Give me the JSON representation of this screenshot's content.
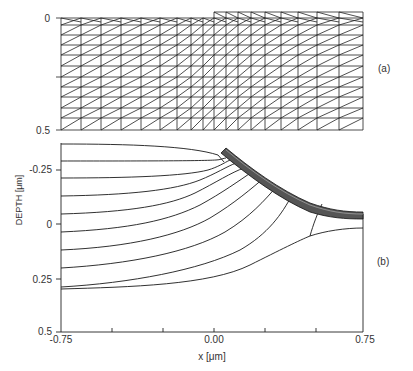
{
  "figure": {
    "panel_a": {
      "label": "(a)",
      "y_ticks": [
        {
          "value": 0,
          "label": "0"
        },
        {
          "value": 0.5,
          "label": "0.5"
        }
      ],
      "description": "Triangular finite-element mesh with a raised step on the right half"
    },
    "panel_b": {
      "label": "(b)",
      "ylabel": "DEPTH [μm]",
      "xlabel": "x [μm]",
      "y_ticks": [
        {
          "value": -0.25,
          "label": "-0.25"
        },
        {
          "value": 0,
          "label": "0"
        },
        {
          "value": 0.25,
          "label": "0.25"
        },
        {
          "value": 0.5,
          "label": "0.5"
        }
      ],
      "x_ticks": [
        {
          "value": -0.75,
          "label": "-0.75"
        },
        {
          "value": -0.5,
          "label": ""
        },
        {
          "value": -0.25,
          "label": ""
        },
        {
          "value": 0.0,
          "label": "0.00"
        },
        {
          "value": 0.25,
          "label": ""
        },
        {
          "value": 0.5,
          "label": ""
        },
        {
          "value": 0.75,
          "label": "0.75"
        }
      ]
    }
  },
  "chart_data": [
    {
      "type": "diagram",
      "title": "(a) finite-element mesh",
      "ylabel": "",
      "ylim": [
        0,
        0.5
      ],
      "rows": 11,
      "columns_left": 14,
      "columns_right": 12
    },
    {
      "type": "line",
      "title": "(b)",
      "xlabel": "x [μm]",
      "ylabel": "DEPTH [μm]",
      "xlim": [
        -0.75,
        0.75
      ],
      "ylim": [
        0.5,
        -0.375
      ],
      "series": [
        {
          "name": "contour-1",
          "x": [
            -0.75,
            -0.25,
            0.0,
            0.02
          ],
          "y": [
            -0.38,
            -0.37,
            -0.35,
            -0.33
          ]
        },
        {
          "name": "contour-2",
          "x": [
            -0.75,
            -0.25,
            0.0,
            0.03
          ],
          "y": [
            -0.3,
            -0.3,
            -0.29,
            -0.31
          ]
        },
        {
          "name": "contour-3",
          "x": [
            -0.75,
            -0.25,
            0.0,
            0.06
          ],
          "y": [
            -0.23,
            -0.23,
            -0.21,
            -0.28
          ]
        },
        {
          "name": "contour-4",
          "x": [
            -0.75,
            -0.25,
            0.0,
            0.1
          ],
          "y": [
            -0.15,
            -0.14,
            -0.11,
            -0.24
          ]
        },
        {
          "name": "contour-5",
          "x": [
            -0.75,
            -0.25,
            0.0,
            0.15
          ],
          "y": [
            -0.08,
            -0.06,
            -0.02,
            -0.2
          ]
        },
        {
          "name": "contour-6",
          "x": [
            -0.75,
            -0.25,
            0.0,
            0.2
          ],
          "y": [
            0.0,
            0.02,
            0.06,
            -0.15
          ]
        },
        {
          "name": "contour-7",
          "x": [
            -0.75,
            -0.25,
            0.0,
            0.27
          ],
          "y": [
            0.08,
            0.1,
            0.14,
            -0.09
          ]
        },
        {
          "name": "contour-8",
          "x": [
            -0.75,
            -0.25,
            0.0,
            0.36
          ],
          "y": [
            0.16,
            0.17,
            0.2,
            -0.04
          ]
        },
        {
          "name": "contour-9",
          "x": [
            -0.75,
            -0.25,
            0.0,
            0.48
          ],
          "y": [
            0.23,
            0.24,
            0.25,
            0.0
          ]
        },
        {
          "name": "contour-10",
          "x": [
            -0.75,
            -0.25,
            0.0,
            0.45,
            0.75
          ],
          "y": [
            0.29,
            0.28,
            0.24,
            0.04,
            0.03
          ]
        },
        {
          "name": "oxide-surface",
          "x": [
            0.0,
            0.25,
            0.5,
            0.75
          ],
          "y": [
            -0.35,
            -0.18,
            -0.05,
            -0.03
          ]
        }
      ]
    }
  ]
}
